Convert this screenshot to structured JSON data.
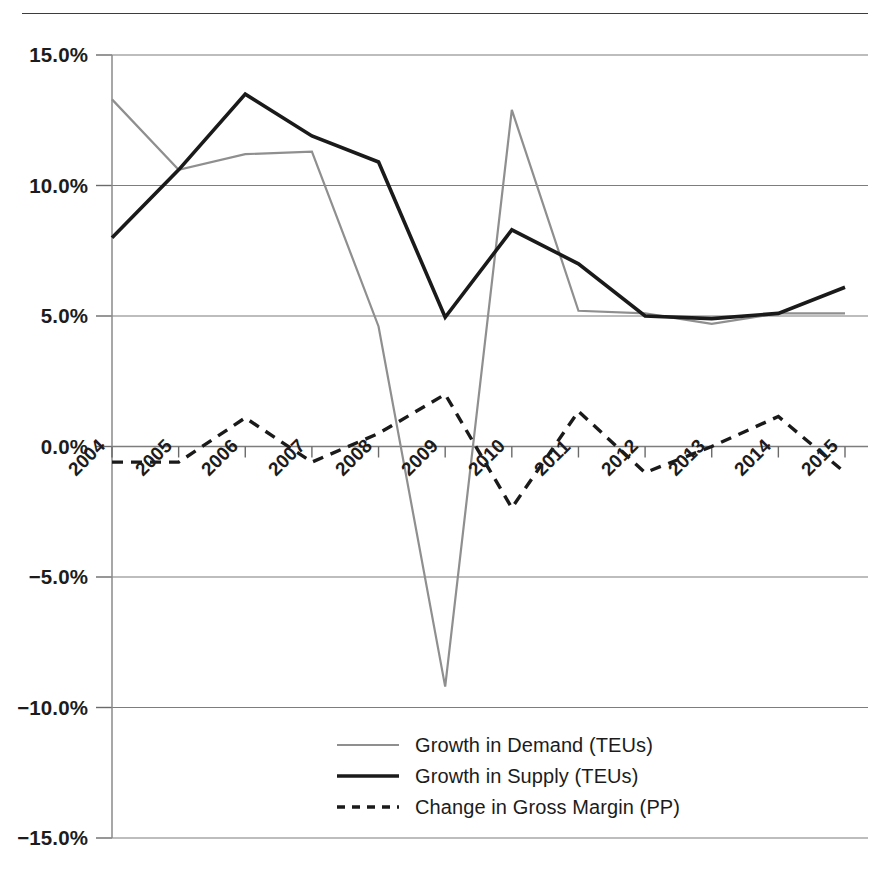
{
  "chart_data": {
    "type": "line",
    "title": "",
    "subtitle": "",
    "xlabel": "",
    "ylabel": "",
    "categories": [
      "2004",
      "2005",
      "2006",
      "2007",
      "2008",
      "2009",
      "2010",
      "2011",
      "2012",
      "2013",
      "2014",
      "2015"
    ],
    "ylim": [
      -15,
      15
    ],
    "ytick_labels": [
      "15.0%",
      "10.0%",
      "5.0%",
      "0.0%",
      "−5.0%",
      "−10.0%",
      "−15.0%"
    ],
    "ytick_values": [
      15,
      10,
      5,
      0,
      -5,
      -10,
      -15
    ],
    "grid": "horizontal",
    "legend_position": "bottom-center",
    "series": [
      {
        "name": "Growth in Demand (TEUs)",
        "style": "solid",
        "color": "#8f8f8f",
        "width": 2.2,
        "values": [
          13.3,
          10.6,
          11.2,
          11.3,
          4.6,
          -9.2,
          12.9,
          5.2,
          5.1,
          4.7,
          5.1,
          5.1
        ]
      },
      {
        "name": "Growth in Supply (TEUs)",
        "style": "solid",
        "color": "#1a1a1a",
        "width": 3.6,
        "values": [
          8.0,
          10.6,
          13.5,
          11.9,
          10.9,
          4.95,
          8.3,
          7.0,
          5.0,
          4.9,
          5.1,
          6.1
        ]
      },
      {
        "name": "Change in Gross Margin (PP)",
        "style": "dashed",
        "color": "#1a1a1a",
        "width": 3.4,
        "values": [
          -0.6,
          -0.6,
          1.1,
          -0.6,
          0.5,
          2.0,
          -2.35,
          1.35,
          -1.0,
          0.0,
          1.15,
          -1.0
        ]
      }
    ],
    "legend": [
      {
        "label": "Growth in Demand (TEUs)",
        "swatch": "solid-gray-line"
      },
      {
        "label": "Growth in Supply (TEUs)",
        "swatch": "solid-black-line"
      },
      {
        "label": "Change in Gross Margin (PP)",
        "swatch": "dashed-black-line"
      }
    ]
  }
}
